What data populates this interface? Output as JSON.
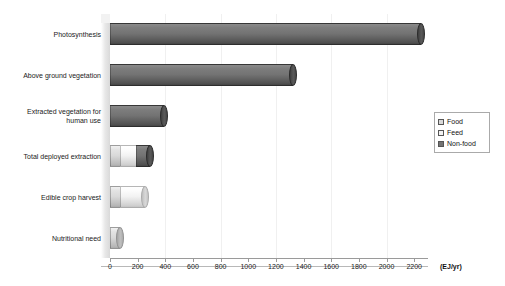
{
  "chart_data": {
    "type": "bar",
    "orientation": "horizontal",
    "stacked": true,
    "style": "3d-cylinder",
    "title": "",
    "subtitle": "",
    "xlabel": "(EJ/yr)",
    "ylabel": "",
    "xlim": [
      0,
      2300
    ],
    "xticks": [
      0,
      200,
      400,
      600,
      800,
      1000,
      1200,
      1400,
      1600,
      1800,
      2000,
      2200
    ],
    "xtick_labels": [
      "0",
      "200",
      "400",
      "600",
      "800",
      "1000",
      "1200",
      "1400",
      "1600",
      "1800",
      "2000",
      "2200"
    ],
    "grid": "vertical-faint",
    "legend_position": "right-middle",
    "categories": [
      "Photosynthesis",
      "Above ground vegetation",
      "Extracted vegetation for human use",
      "Total deployed extraction",
      "Edible crop harvest",
      "Nutritional need"
    ],
    "series": [
      {
        "name": "Food",
        "color": "#d9d9d9",
        "values": [
          0,
          0,
          0,
          70,
          70,
          70
        ]
      },
      {
        "name": "Feed",
        "color": "#f2f2f2",
        "values": [
          0,
          0,
          0,
          115,
          180,
          0
        ]
      },
      {
        "name": "Non-food",
        "color": "#737373",
        "values": [
          2250,
          1320,
          390,
          105,
          0,
          0
        ]
      }
    ],
    "totals": [
      2250,
      1320,
      390,
      290,
      250,
      70
    ],
    "annotations": []
  },
  "axis": {
    "unit_label": "(EJ/yr)"
  },
  "legend": {
    "items": [
      {
        "label": "Food",
        "color": "#d9d9d9"
      },
      {
        "label": "Feed",
        "color": "#f2f2f2"
      },
      {
        "label": "Non-food",
        "color": "#737373"
      }
    ]
  },
  "colors": {
    "food": "#d9d9d9",
    "feed": "#f2f2f2",
    "non_food": "#737373",
    "axis": "#9a9a9a",
    "grid": "#f0f0f0",
    "text": "#1a1a1a",
    "background": "#ffffff"
  }
}
